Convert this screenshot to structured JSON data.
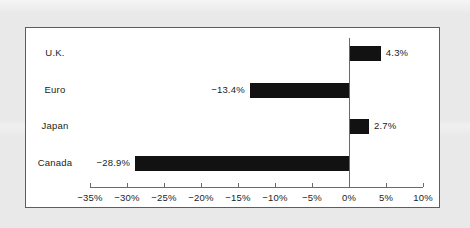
{
  "chart_data": {
    "type": "bar",
    "orientation": "horizontal",
    "title": "",
    "subtitle": "",
    "xlabel": "",
    "ylabel": "",
    "categories": [
      "U.K.",
      "Euro",
      "Japan",
      "Canada"
    ],
    "values": [
      4.3,
      -13.4,
      2.7,
      -28.9
    ],
    "data_labels": [
      "4.3%",
      "−13.4%",
      "2.7%",
      "−28.9%"
    ],
    "xlim": [
      -35,
      10
    ],
    "xtick_values": [
      -35,
      -30,
      -25,
      -20,
      -15,
      -10,
      -5,
      0,
      5,
      10
    ],
    "xtick_labels": [
      "−35%",
      "−30%",
      "−25%",
      "−20%",
      "−15%",
      "−10%",
      "−5%",
      "0%",
      "5%",
      "10%"
    ],
    "grid": false,
    "legend": false,
    "legend_position": "none",
    "bar_color": "#121212",
    "axis_color": "#6a6a6a",
    "frame_color": "#5d5d5d",
    "plot_background": "#ffffff",
    "page_background": "#e9e9e9"
  },
  "rows": [
    {
      "category": "U.K.",
      "value": 4.3,
      "label": "4.3%"
    },
    {
      "category": "Euro",
      "value": -13.4,
      "label": "−13.4%"
    },
    {
      "category": "Japan",
      "value": 2.7,
      "label": "2.7%"
    },
    {
      "category": "Canada",
      "value": -28.9,
      "label": "−28.9%"
    }
  ]
}
